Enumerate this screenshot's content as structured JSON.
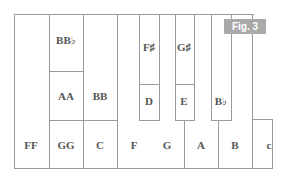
{
  "figure": {
    "badge": "Fig. 3",
    "badge_color": "#a9a9a9",
    "line_color": "#9a9a9a",
    "text_color": "#555555"
  },
  "keys": {
    "bottom_row": [
      "FF",
      "GG",
      "C",
      "F",
      "G",
      "A",
      "B",
      "c"
    ],
    "middle_row": [
      "AA",
      "BB",
      "D",
      "E",
      "B♭"
    ],
    "top_row": [
      "BB♭",
      "F♯",
      "G♯"
    ]
  }
}
